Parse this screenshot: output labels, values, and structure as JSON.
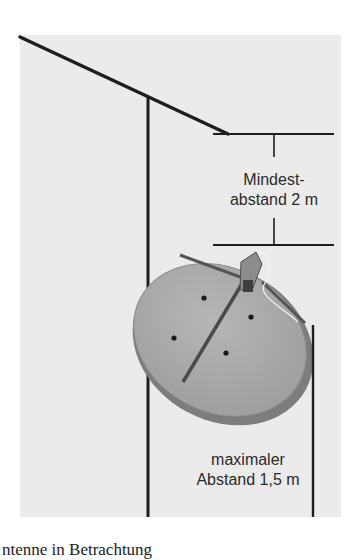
{
  "diagram": {
    "type": "satellite-dish-mounting-distance",
    "labels": {
      "min_distance_line1": "Mindest-",
      "min_distance_line2": "abstand 2 m",
      "max_distance_line1": "maximaler",
      "max_distance_line2": "Abstand 1,5 m"
    },
    "caption_partial": "ntenne in Betrachtung",
    "colors": {
      "background_panel": "#ececec",
      "line": "#1e1e1e",
      "dish_face": "#a9a9a9",
      "dish_rim": "#7d7d7d",
      "text": "#2a2a2a"
    },
    "elements": [
      "roof-line",
      "wall-pole",
      "min-distance-bracket",
      "satellite-dish",
      "max-distance-line"
    ]
  }
}
